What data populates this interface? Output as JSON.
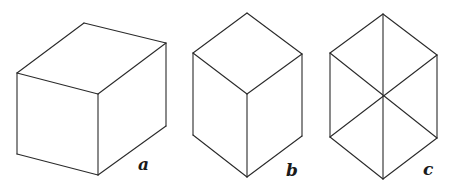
{
  "figures": [
    {
      "id": "a",
      "label": "a",
      "description": "rectangular box drawn in oblique/isometric-like projection",
      "label_pos": [
        138,
        170
      ],
      "edges": [
        [
          [
            84,
            23
          ],
          [
            166,
            43
          ]
        ],
        [
          [
            84,
            23
          ],
          [
            17,
            73
          ]
        ],
        [
          [
            17,
            73
          ],
          [
            98,
            94
          ]
        ],
        [
          [
            166,
            43
          ],
          [
            98,
            94
          ]
        ],
        [
          [
            17,
            73
          ],
          [
            17,
            154
          ]
        ],
        [
          [
            98,
            94
          ],
          [
            98,
            175
          ]
        ],
        [
          [
            166,
            43
          ],
          [
            166,
            126
          ]
        ],
        [
          [
            17,
            154
          ],
          [
            98,
            175
          ]
        ],
        [
          [
            98,
            175
          ],
          [
            166,
            126
          ]
        ]
      ]
    },
    {
      "id": "b",
      "label": "b",
      "description": "cube drawn in isometric projection",
      "label_pos": [
        286,
        176
      ],
      "edges": [
        [
          [
            247,
            13
          ],
          [
            193,
            53
          ]
        ],
        [
          [
            247,
            13
          ],
          [
            302,
            54
          ]
        ],
        [
          [
            193,
            53
          ],
          [
            247,
            94
          ]
        ],
        [
          [
            302,
            54
          ],
          [
            247,
            94
          ]
        ],
        [
          [
            193,
            53
          ],
          [
            193,
            135
          ]
        ],
        [
          [
            247,
            94
          ],
          [
            247,
            177
          ]
        ],
        [
          [
            302,
            54
          ],
          [
            302,
            136
          ]
        ],
        [
          [
            193,
            135
          ],
          [
            247,
            177
          ]
        ],
        [
          [
            247,
            177
          ],
          [
            302,
            136
          ]
        ]
      ]
    },
    {
      "id": "c",
      "label": "c",
      "description": "regular hexagon with all three main diagonals through the center",
      "label_pos": [
        423,
        175
      ],
      "edges": [
        [
          [
            383,
            14
          ],
          [
            437,
            55
          ]
        ],
        [
          [
            437,
            55
          ],
          [
            437,
            138
          ]
        ],
        [
          [
            437,
            138
          ],
          [
            383,
            179
          ]
        ],
        [
          [
            383,
            179
          ],
          [
            330,
            137
          ]
        ],
        [
          [
            330,
            137
          ],
          [
            330,
            53
          ]
        ],
        [
          [
            330,
            53
          ],
          [
            383,
            14
          ]
        ],
        [
          [
            383,
            14
          ],
          [
            383,
            179
          ]
        ],
        [
          [
            330,
            53
          ],
          [
            437,
            138
          ]
        ],
        [
          [
            437,
            55
          ],
          [
            330,
            137
          ]
        ]
      ]
    }
  ],
  "colors": {
    "background": "#ffffff",
    "stroke": "#2a2a2a"
  }
}
